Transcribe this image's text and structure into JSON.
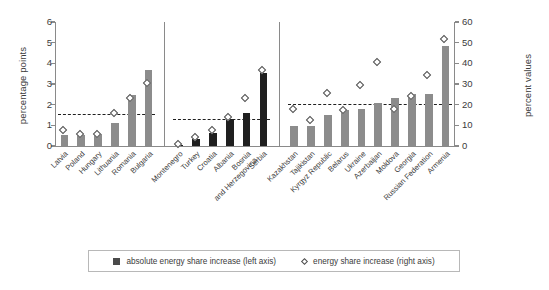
{
  "chart_data": {
    "type": "bar",
    "title": "",
    "subtitle": "",
    "xlabel": "",
    "ylabel": "percentage points",
    "y2label": "percent values",
    "ylim": [
      0,
      6
    ],
    "y2lim": [
      0,
      60
    ],
    "y_ticks": [
      "0",
      "1",
      "2",
      "3",
      "4",
      "5",
      "6"
    ],
    "y2_ticks": [
      "0",
      "10",
      "20",
      "30",
      "40",
      "50",
      "60"
    ],
    "grid": false,
    "legend_position": "bottom",
    "legend": [
      {
        "marker": "bar-swatch",
        "label": "absolute energy share increase (left axis)"
      },
      {
        "marker": "diamond-marker",
        "label": "energy share increase (right axis)"
      }
    ],
    "series": [
      {
        "name": "absolute energy share increase (left axis)",
        "axis": "left",
        "type": "bar"
      },
      {
        "name": "energy share increase (right axis)",
        "axis": "right",
        "type": "scatter"
      }
    ],
    "groups": [
      {
        "name": "EU New Member States",
        "bar_color": "#8c8c8c",
        "average_line_left_value": 1.55,
        "categories": [
          "Latvia",
          "Poland",
          "Hungary",
          "Lithuania",
          "Romania",
          "Bulgaria"
        ],
        "values_left": [
          0.55,
          0.55,
          0.6,
          1.1,
          2.45,
          3.7
        ],
        "values_right": [
          7.0,
          5.0,
          5.0,
          15.5,
          22.5,
          30.0
        ]
      },
      {
        "name": "South-Eastern Europe",
        "bar_color": "#1f1f1f",
        "average_line_left_value": 1.3,
        "categories": [
          "Montenegro",
          "Turkey",
          "Croatia",
          "Albania",
          "Bosnia and Herzegovina",
          "Serbia"
        ],
        "values_left": [
          0.02,
          0.35,
          0.65,
          1.3,
          1.6,
          3.55
        ],
        "values_right": [
          0.5,
          3.5,
          7.0,
          13.5,
          22.5,
          36.0
        ]
      },
      {
        "name": "Commonwealth of Independent States",
        "bar_color": "#8c8c8c",
        "average_line_left_value": 2.05,
        "categories": [
          "Kazakhstan",
          "Tajikistan",
          "Kyrgyz Republic",
          "Belarus",
          "Ukraine",
          "Azerbaijan",
          "Moldova",
          "Georgia",
          "Russian Federation",
          "Armenia"
        ],
        "values_left": [
          0.95,
          0.95,
          1.5,
          1.75,
          1.8,
          2.1,
          2.3,
          2.5,
          2.5,
          4.85
        ],
        "values_right": [
          17.5,
          12.0,
          25.0,
          17.0,
          29.0,
          40.0,
          17.5,
          23.5,
          33.5,
          51.0
        ]
      }
    ]
  }
}
